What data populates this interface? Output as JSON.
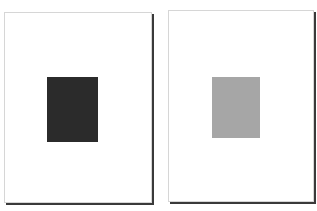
{
  "figure": {
    "pages": [
      {
        "name": "left-page",
        "block_color": "#2b2b2b",
        "block_label": "dark text block"
      },
      {
        "name": "right-page",
        "block_color": "#a6a6a6",
        "block_label": "light gray text block"
      }
    ]
  }
}
